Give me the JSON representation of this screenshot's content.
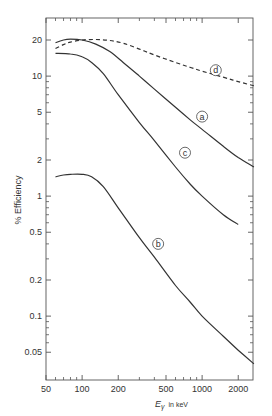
{
  "chart_data": {
    "type": "line",
    "title": "",
    "xlabel": "Eγ in keV",
    "xlabel_main": "E",
    "xlabel_sub": "γ",
    "xlabel_unit": "in keV",
    "ylabel": "% Efficiency",
    "xscale": "log",
    "yscale": "log",
    "xlim": [
      50,
      2800
    ],
    "ylim": [
      0.035,
      26
    ],
    "grid": false,
    "legend": "inline circled letters",
    "x_ticks": [
      50,
      100,
      200,
      500,
      1000,
      2000
    ],
    "x_tick_labels": [
      "50",
      "100",
      "200",
      "500",
      "1000",
      "2000"
    ],
    "y_ticks": [
      0.05,
      0.1,
      0.2,
      0.5,
      1,
      2,
      5,
      10,
      20
    ],
    "y_tick_labels": [
      "0.05",
      "0.1",
      "0.2",
      "0.5",
      "1",
      "2",
      "5",
      "10",
      "20"
    ],
    "series": [
      {
        "name": "a",
        "style": "solid",
        "x": [
          60,
          70,
          80,
          100,
          130,
          170,
          220,
          300,
          400,
          600,
          800,
          1000,
          1500,
          2000,
          2700
        ],
        "y": [
          19.0,
          20.0,
          20.3,
          20.0,
          18.5,
          16.0,
          13.0,
          10.0,
          7.8,
          5.5,
          4.3,
          3.6,
          2.6,
          2.1,
          1.75
        ]
      },
      {
        "name": "b",
        "style": "solid",
        "x": [
          60,
          70,
          80,
          100,
          120,
          150,
          200,
          300,
          400,
          600,
          800,
          1000,
          1500,
          2000,
          2700
        ],
        "y": [
          1.45,
          1.5,
          1.52,
          1.52,
          1.45,
          1.2,
          0.8,
          0.45,
          0.31,
          0.18,
          0.13,
          0.1,
          0.068,
          0.052,
          0.04
        ]
      },
      {
        "name": "c",
        "style": "solid",
        "x": [
          60,
          80,
          100,
          120,
          150,
          200,
          300,
          400,
          600,
          800,
          1000,
          1500,
          2000
        ],
        "y": [
          15.5,
          15.3,
          14.5,
          13.0,
          10.5,
          7.0,
          4.1,
          2.9,
          1.75,
          1.25,
          1.0,
          0.7,
          0.58
        ]
      },
      {
        "name": "d",
        "style": "dashed",
        "x": [
          60,
          70,
          80,
          100,
          130,
          170,
          220,
          300,
          400,
          600,
          800,
          1000,
          1500,
          2000,
          2700
        ],
        "y": [
          17.0,
          18.3,
          19.2,
          20.0,
          20.2,
          19.8,
          18.8,
          16.8,
          15.0,
          13.0,
          11.8,
          11.0,
          9.8,
          9.0,
          8.3
        ]
      }
    ],
    "annotations": [
      {
        "label": "d",
        "x": 1300,
        "y": 11.2
      },
      {
        "label": "a",
        "x": 1000,
        "y": 4.6
      },
      {
        "label": "c",
        "x": 720,
        "y": 2.3
      },
      {
        "label": "b",
        "x": 430,
        "y": 0.4
      }
    ]
  }
}
